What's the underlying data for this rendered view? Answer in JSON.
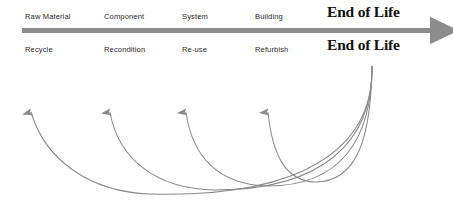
{
  "diagram": {
    "colors": {
      "main_arrow": "#8c8c8c",
      "curve_stroke": "#8a8a8a",
      "stage_text": "#2b2b2b",
      "eol_text": "#121212",
      "background": "#ffffff"
    },
    "forward_flow": {
      "arrow_name": "main-lifecycle-arrow",
      "stages": [
        {
          "label": "Raw Material",
          "x": 25,
          "y": 12
        },
        {
          "label": "Component",
          "x": 104,
          "y": 12
        },
        {
          "label": "System",
          "x": 182,
          "y": 12
        },
        {
          "label": "Building",
          "x": 255,
          "y": 12
        }
      ],
      "end_label": {
        "label": "End of Life",
        "x": 327,
        "y": 3
      }
    },
    "recovery_flow": {
      "stages": [
        {
          "label": "Recycle",
          "x": 25,
          "y": 45,
          "arrow_x": 31
        },
        {
          "label": "Recondition",
          "x": 104,
          "y": 45,
          "arrow_x": 110
        },
        {
          "label": "Re-use",
          "x": 182,
          "y": 45,
          "arrow_x": 186
        },
        {
          "label": "Refurbish",
          "x": 255,
          "y": 45,
          "arrow_x": 268
        }
      ],
      "end_label": {
        "label": "End of Life",
        "x": 327,
        "y": 36
      },
      "convergence_point": {
        "x": 372,
        "y": 66
      }
    }
  }
}
